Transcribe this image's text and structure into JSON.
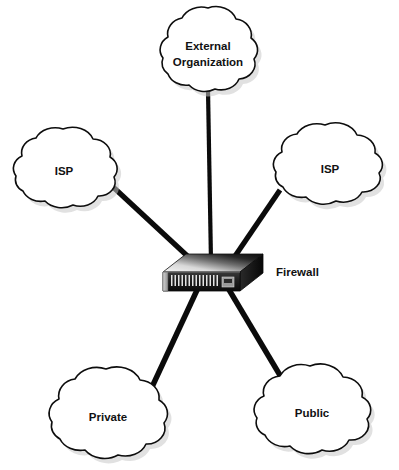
{
  "diagram": {
    "canvas": {
      "width": 399,
      "height": 470,
      "background": "#ffffff"
    },
    "colors": {
      "line": "#0b0b0b",
      "cloud_stroke": "#0d0d0d",
      "cloud_fill": "#ffffff",
      "cloud_shadow": "#c9c9c9",
      "text": "#111111",
      "device_top_light": "#f2f2f2",
      "device_top_dark": "#121212",
      "device_front": "#1a1a1a",
      "device_vent": "#e8e8e8"
    },
    "nodes": [
      {
        "id": "external-organization",
        "type": "cloud",
        "label": "External Organization",
        "label_lines": [
          "External",
          "Organization"
        ],
        "cx": 208,
        "cy": 52,
        "rx": 52,
        "ry": 40
      },
      {
        "id": "isp-left",
        "type": "cloud",
        "label": "ISP",
        "label_lines": [
          "ISP"
        ],
        "cx": 68,
        "cy": 170,
        "rx": 57,
        "ry": 39
      },
      {
        "id": "isp-right",
        "type": "cloud",
        "label": "ISP",
        "label_lines": [
          "ISP"
        ],
        "cx": 334,
        "cy": 166,
        "rx": 62,
        "ry": 39
      },
      {
        "id": "private",
        "type": "cloud",
        "label": "Private",
        "label_lines": [
          "Private"
        ],
        "cx": 113,
        "cy": 416,
        "rx": 65,
        "ry": 44
      },
      {
        "id": "public",
        "type": "cloud",
        "label": "Public",
        "label_lines": [
          "Public"
        ],
        "cx": 316,
        "cy": 411,
        "rx": 62,
        "ry": 43
      },
      {
        "id": "firewall",
        "type": "appliance",
        "label": "Firewall",
        "label_x": 276,
        "label_y": 272,
        "cx": 212,
        "cy": 276
      }
    ],
    "links": [
      {
        "id": "link-external-organization",
        "from": "external-organization",
        "to": "firewall",
        "x1": 208,
        "y1": 90,
        "x2": 211,
        "y2": 262,
        "width": 4.2
      },
      {
        "id": "link-isp-left",
        "from": "isp-left",
        "to": "firewall",
        "x1": 112,
        "y1": 186,
        "x2": 196,
        "y2": 264,
        "width": 5.2
      },
      {
        "id": "link-isp-right",
        "from": "isp-right",
        "to": "firewall",
        "x1": 280,
        "y1": 190,
        "x2": 231,
        "y2": 262,
        "width": 5.2
      },
      {
        "id": "link-private",
        "from": "firewall",
        "to": "private",
        "x1": 198,
        "y1": 290,
        "x2": 152,
        "y2": 387,
        "width": 5.4
      },
      {
        "id": "link-public",
        "from": "firewall",
        "to": "public",
        "x1": 228,
        "y1": 290,
        "x2": 284,
        "y2": 382,
        "width": 5.4
      }
    ]
  }
}
